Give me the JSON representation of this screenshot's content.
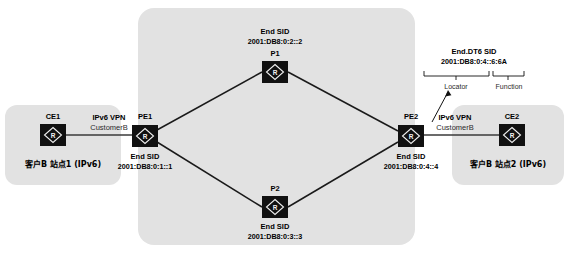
{
  "diagram": {
    "colors": {
      "region_fill": "#e2e2e2",
      "node_fill": "#111111",
      "link_stroke": "#1a1a1a",
      "text": "#000000"
    }
  },
  "regions": {
    "core_label": "",
    "site_left_label": "客户B 站点1  (IPv6)",
    "site_right_label": "客户B 站点2  (IPv6)"
  },
  "nodes": {
    "ce1": {
      "name": "CE1",
      "icon": "router-icon"
    },
    "pe1": {
      "name": "PE1",
      "icon": "router-icon",
      "sid_title": "End SID",
      "sid_value": "2001:DB8:0:1::1"
    },
    "p1": {
      "name": "P1",
      "icon": "router-icon",
      "sid_title": "End SID",
      "sid_value": "2001:DB8:0:2::2"
    },
    "p2": {
      "name": "P2",
      "icon": "router-icon",
      "sid_title": "End SID",
      "sid_value": "2001:DB8:0:3::3"
    },
    "pe2": {
      "name": "PE2",
      "icon": "router-icon",
      "sid_title": "End SID",
      "sid_value": "2001:DB8:0:4::4"
    },
    "ce2": {
      "name": "CE2",
      "icon": "router-icon"
    }
  },
  "links": {
    "left_vpn_title": "IPv6 VPN",
    "left_vpn_sub": "CustomerB",
    "right_vpn_title": "IPv6 VPN",
    "right_vpn_sub": "CustomerB"
  },
  "callout": {
    "title": "End.DT6 SID",
    "value": "2001:DB8:0:4::6:6A",
    "part_locator": "Locator",
    "part_function": "Function"
  }
}
